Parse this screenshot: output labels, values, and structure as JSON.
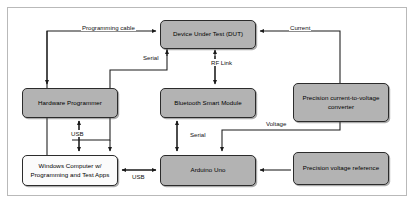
{
  "figure": {
    "border_color": "#b9b9b9",
    "node_fill_gray": "#b3b3b3",
    "node_fill_white": "#fbfbfb",
    "wire_color": "#1a1a1a"
  },
  "nodes": [
    {
      "id": "dut",
      "label": "Device Under Test (DUT)",
      "fill": "gray"
    },
    {
      "id": "programmer",
      "label": "Hardware Programmer",
      "fill": "gray"
    },
    {
      "id": "bluetooth",
      "label": "Bluetooth Smart Module",
      "fill": "gray"
    },
    {
      "id": "converter",
      "label": "Precision current-to-voltage converter",
      "fill": "gray"
    },
    {
      "id": "windows",
      "label": "Windows Computer w/ Programming and Test Apps",
      "fill": "white"
    },
    {
      "id": "arduino",
      "label": "Arduino Uno",
      "fill": "gray"
    },
    {
      "id": "vref",
      "label": "Precision voltage reference",
      "fill": "gray"
    }
  ],
  "connections": [
    {
      "id": "programming-cable",
      "label": "Programming cable",
      "from": "windows",
      "to": "dut"
    },
    {
      "id": "serial-dut",
      "label": "Serial",
      "from": "dut",
      "to": "windows"
    },
    {
      "id": "rf-link",
      "label": "RF Link",
      "from": "dut",
      "to": "bluetooth"
    },
    {
      "id": "current",
      "label": "Current",
      "from": "converter",
      "to": "dut"
    },
    {
      "id": "usb-programmer",
      "label": "USB",
      "from": "windows",
      "to": "programmer"
    },
    {
      "id": "serial-arduino",
      "label": "Serial",
      "from": "bluetooth",
      "to": "arduino"
    },
    {
      "id": "voltage",
      "label": "Voltage",
      "from": "converter",
      "to": "arduino"
    },
    {
      "id": "usb-arduino",
      "label": "USB",
      "from": "windows",
      "to": "arduino"
    },
    {
      "id": "vref-arduino",
      "label": "",
      "from": "vref",
      "to": "arduino"
    }
  ]
}
